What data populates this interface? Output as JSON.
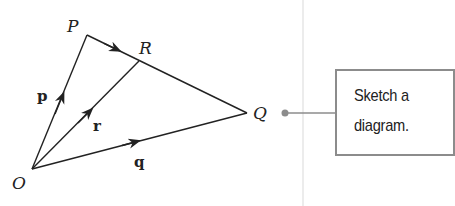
{
  "diagram": {
    "points": {
      "O": {
        "label": "O",
        "x": 32,
        "y": 169
      },
      "P": {
        "label": "P",
        "x": 87,
        "y": 35
      },
      "Q": {
        "label": "Q",
        "x": 247,
        "y": 113
      },
      "R": {
        "label": "R",
        "x": 139,
        "y": 61
      }
    },
    "vectors": {
      "p": {
        "label": "p",
        "from": "O",
        "to": "P"
      },
      "q": {
        "label": "q",
        "from": "O",
        "to": "Q"
      },
      "r": {
        "label": "r",
        "from": "O",
        "to": "R"
      }
    },
    "segments": [
      {
        "from": "O",
        "to": "P",
        "arrow": true
      },
      {
        "from": "O",
        "to": "R",
        "arrow": true
      },
      {
        "from": "O",
        "to": "Q",
        "arrow": true
      },
      {
        "from": "P",
        "to": "Q",
        "arrow": true
      }
    ]
  },
  "callout": {
    "line1": "Sketch a",
    "line2": "diagram."
  },
  "colors": {
    "line": "#222222",
    "callout_border": "#8c8c8c",
    "connector": "#8c8c8c",
    "divider": "#ececec"
  }
}
